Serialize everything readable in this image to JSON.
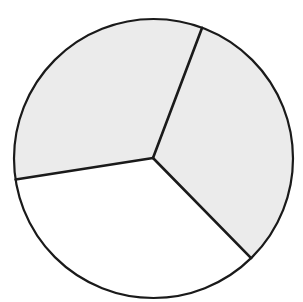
{
  "figure": {
    "type": "circle-divided-into-sectors",
    "canvas": {
      "width": 303,
      "height": 302,
      "background": "#ffffff"
    },
    "circle": {
      "cx": 153.5,
      "cy": 158.5,
      "r": 139.5,
      "stroke": "#1a1a1a",
      "stroke_width": 2.2
    },
    "center": {
      "x": 153,
      "y": 158
    },
    "divider_color": "#1a1a1a",
    "divider_width": 2.6,
    "sectors": [
      {
        "name": "right-sector",
        "shaded": true,
        "fill": "#ebebeb",
        "start_point": [
          202,
          28
        ],
        "end_point": [
          249,
          256
        ],
        "angle_deg": 115
      },
      {
        "name": "bottom-sector",
        "shaded": false,
        "fill": "#ffffff",
        "start_point": [
          249,
          256
        ],
        "end_point": [
          19,
          179
        ],
        "angle_deg": 125.5
      },
      {
        "name": "upper-left-sector",
        "shaded": true,
        "fill": "#ebebeb",
        "start_point": [
          19,
          179
        ],
        "end_point": [
          202,
          28
        ],
        "angle_deg": 119.5
      }
    ],
    "summary": {
      "total_sectors": 3,
      "shaded_sectors": 2,
      "unshaded_sectors": 1
    }
  }
}
